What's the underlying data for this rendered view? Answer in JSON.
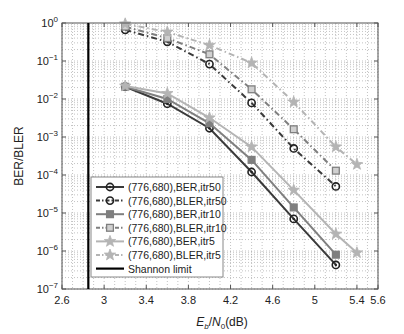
{
  "chart_data": {
    "type": "line",
    "title": "",
    "xlabel": "Eb/N0(dB)",
    "ylabel": "BER/BLER",
    "xscale": "linear",
    "yscale": "log",
    "xlim": [
      2.6,
      5.6
    ],
    "ylim": [
      1e-07,
      1
    ],
    "xticks": [
      2.6,
      3,
      3.4,
      3.8,
      4.2,
      4.6,
      5,
      5.4,
      5.6
    ],
    "xtick_labels": [
      "2.6",
      "3",
      "3.4",
      "3.8",
      "4.2",
      "4.6",
      "5",
      "5.4",
      "5.6"
    ],
    "yticks": [
      1e-07,
      1e-06,
      1e-05,
      0.0001,
      0.001,
      0.01,
      0.1,
      1
    ],
    "ytick_exponents": [
      "-7",
      "-6",
      "-5",
      "-4",
      "-3",
      "-2",
      "-1",
      "0"
    ],
    "grid": true,
    "legend_position": "lower left",
    "series": [
      {
        "name": "(776,680),BER,itr50",
        "x": [
          3.2,
          3.6,
          4.0,
          4.4,
          4.8,
          5.2
        ],
        "values": [
          0.021,
          0.0075,
          0.0017,
          0.00012,
          7e-06,
          4.3e-07
        ],
        "marker": "circle",
        "line": "solid",
        "color": "#3a3a3a"
      },
      {
        "name": "(776,680),BLER,itr50",
        "x": [
          3.2,
          3.6,
          4.0,
          4.4,
          4.8,
          5.2
        ],
        "values": [
          0.66,
          0.32,
          0.083,
          0.0079,
          0.0005,
          5e-05
        ],
        "marker": "circle-open",
        "line": "dashdot",
        "color": "#3a3a3a"
      },
      {
        "name": "(776,680),BER,itr10",
        "x": [
          3.2,
          3.6,
          4.0,
          4.4,
          4.8,
          5.2
        ],
        "values": [
          0.021,
          0.01,
          0.0023,
          0.00025,
          1.4e-05,
          8e-07
        ],
        "marker": "square",
        "line": "solid",
        "color": "#7f7f7f"
      },
      {
        "name": "(776,680),BLER,itr10",
        "x": [
          3.2,
          3.6,
          4.0,
          4.4,
          4.8,
          5.2
        ],
        "values": [
          0.8,
          0.4,
          0.15,
          0.018,
          0.0016,
          0.00013
        ],
        "marker": "square-open",
        "line": "dashdot",
        "color": "#7f7f7f"
      },
      {
        "name": "(776,680),BER,itr5",
        "x": [
          3.2,
          3.6,
          4.0,
          4.4,
          4.8,
          5.2,
          5.4
        ],
        "values": [
          0.022,
          0.014,
          0.0032,
          0.00055,
          4e-05,
          2.8e-06,
          9e-07
        ],
        "marker": "star",
        "line": "solid",
        "color": "#b4b4b4"
      },
      {
        "name": "(776,680),BLER,itr5",
        "x": [
          3.2,
          3.6,
          4.0,
          4.4,
          4.8,
          5.2,
          5.4
        ],
        "values": [
          0.95,
          0.58,
          0.26,
          0.089,
          0.0083,
          0.00055,
          0.00019
        ],
        "marker": "star",
        "line": "dashdot",
        "color": "#b4b4b4"
      }
    ],
    "annotations": [
      {
        "name": "Shannon limit",
        "type": "vline",
        "x": 2.85,
        "color": "#000000"
      }
    ],
    "legend": [
      "(776,680),BER,itr50",
      "(776,680),BLER,itr50",
      "(776,680),BER,itr10",
      "(776,680),BLER,itr10",
      "(776,680),BER,itr5",
      "(776,680),BLER,itr5",
      "Shannon limit"
    ]
  },
  "labels": {
    "ylabel": "BER/BLER",
    "xlabel_E": "E",
    "xlabel_b": "b",
    "xlabel_slash": "/",
    "xlabel_N": "N",
    "xlabel_0": "0",
    "xlabel_unit": "(dB)"
  }
}
